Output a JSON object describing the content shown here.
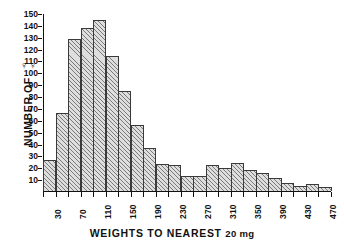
{
  "chart_data": {
    "type": "bar",
    "title": "",
    "subtitle": "",
    "xlabel": "WEIGHTS TO NEAREST 20 mg",
    "xlabel_main": "WEIGHTS TO NEAREST",
    "xlabel_unit": "20 mg",
    "ylabel": "NUMBER OF",
    "ylabel_symbol": "♀♀",
    "ylabel_full": "NUMBER OF ♀♀",
    "grid": false,
    "legend": "none",
    "ylim": [
      0,
      150
    ],
    "ytick_labels": [
      "150",
      "140",
      "130",
      "120",
      "110",
      "100",
      "90",
      "80",
      "70",
      "60",
      "50",
      "40",
      "30",
      "20",
      "10"
    ],
    "ytick_values": [
      150,
      140,
      130,
      120,
      110,
      100,
      90,
      80,
      70,
      60,
      50,
      40,
      30,
      20,
      10
    ],
    "xlim": [
      20,
      480
    ],
    "bin_width": 20,
    "xtick_labels": [
      "30",
      "70",
      "110",
      "150",
      "190",
      "230",
      "270",
      "310",
      "350",
      "390",
      "430",
      "470"
    ],
    "xtick_values": [
      30,
      70,
      110,
      150,
      190,
      230,
      270,
      310,
      350,
      390,
      430,
      470
    ],
    "categories": [
      "30",
      "50",
      "70",
      "90",
      "110",
      "130",
      "150",
      "170",
      "190",
      "210",
      "230",
      "250",
      "270",
      "290",
      "310",
      "330",
      "350",
      "370",
      "390",
      "410",
      "430",
      "450",
      "470"
    ],
    "values": [
      26,
      66,
      128,
      137,
      144,
      114,
      84,
      56,
      36,
      23,
      22,
      13,
      13,
      22,
      19,
      24,
      18,
      15,
      11,
      7,
      4,
      6,
      3
    ],
    "series": [
      {
        "name": "Number of females",
        "values": [
          26,
          66,
          128,
          137,
          144,
          114,
          84,
          56,
          36,
          23,
          22,
          13,
          13,
          22,
          19,
          24,
          18,
          15,
          11,
          7,
          4,
          6,
          3
        ]
      }
    ],
    "bar_fill": "#dedede",
    "bar_hatch": "diagonal",
    "bar_edge_color": "#3a3a3a",
    "axis_color": "#111111",
    "background": "#ffffff"
  }
}
